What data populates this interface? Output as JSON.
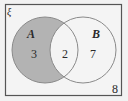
{
  "diagram": {
    "type": "venn",
    "universal_set_label": "ξ",
    "sets": [
      {
        "name": "A",
        "only_count": "3",
        "shaded": true
      },
      {
        "name": "B",
        "only_count": "7",
        "shaded": false
      }
    ],
    "intersection_count": "2",
    "outside_count": "8",
    "colors": {
      "background": "#f2f2f2",
      "frame": "#555555",
      "circle_stroke": "#8a8a8a",
      "shade": "#b3b3b3"
    }
  }
}
